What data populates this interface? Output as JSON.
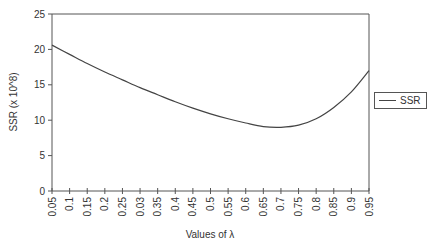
{
  "chart_data": {
    "type": "line",
    "title": "",
    "xlabel": "Values of λ",
    "ylabel": "SSR (x 10^8)",
    "ylim": [
      0,
      25
    ],
    "yticks": [
      0,
      5,
      10,
      15,
      20,
      25
    ],
    "grid": false,
    "legend_position": "right",
    "categories": [
      "0.05",
      "0.1",
      "0.15",
      "0.2",
      "0.25",
      "0.03",
      "0.35",
      "0.4",
      "0.45",
      "0.5",
      "0.55",
      "0.6",
      "0.65",
      "0.7",
      "0.75",
      "0.8",
      "0.85",
      "0.9",
      "0.95"
    ],
    "series": [
      {
        "name": "SSR",
        "color": "#444444",
        "values": [
          20.6,
          19.3,
          18.0,
          16.8,
          15.7,
          14.6,
          13.6,
          12.6,
          11.7,
          10.9,
          10.2,
          9.6,
          9.1,
          9.0,
          9.3,
          10.2,
          11.8,
          14.0,
          17.0
        ]
      }
    ]
  },
  "legend": {
    "label": "SSR"
  }
}
